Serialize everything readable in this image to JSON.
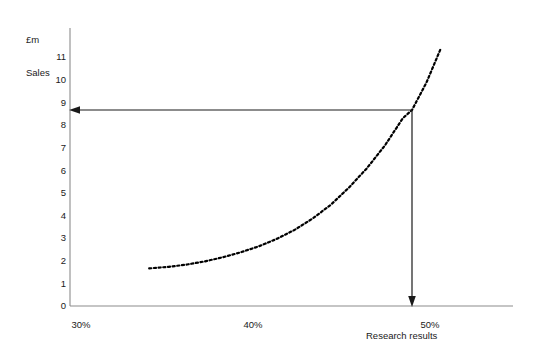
{
  "chart_data": {
    "type": "line",
    "title": "",
    "subtitle": "",
    "ylabel": "£m\nSales",
    "ylabel_line1": "£m",
    "ylabel_line2": "Sales",
    "xlabel": "Research results",
    "ylim": [
      0,
      11.5
    ],
    "xlim": [
      29,
      52
    ],
    "grid": false,
    "legend": null,
    "ytick_labels": [
      "11",
      "10",
      "9",
      "8",
      "7",
      "6",
      "5",
      "4",
      "3",
      "2",
      "1",
      "0"
    ],
    "ytick_values": [
      11,
      10,
      9,
      8,
      7,
      6,
      5,
      4,
      3,
      2,
      1,
      0
    ],
    "xtick_labels": [
      "30%",
      "40%",
      "50%"
    ],
    "xtick_values": [
      30,
      40,
      50
    ],
    "series": [
      {
        "name": "Sales curve",
        "style": "dotted",
        "color": "#000000",
        "x": [
          34.4,
          35.5,
          36.5,
          37.5,
          38.5,
          39.5,
          40.5,
          41.5,
          42.5,
          43.5,
          44.5,
          45.5,
          46.5,
          47.5,
          48.5,
          49.0,
          49.8,
          50.6
        ],
        "y": [
          1.65,
          1.72,
          1.82,
          1.96,
          2.14,
          2.36,
          2.62,
          2.95,
          3.35,
          3.85,
          4.45,
          5.2,
          6.05,
          7.05,
          8.25,
          8.6,
          9.8,
          11.3
        ]
      }
    ],
    "annotations": [
      {
        "name": "horizontal-readoff-arrow",
        "from_x": 49.0,
        "from_y": 8.6,
        "to_x": 30.0,
        "to_y": 8.6,
        "arrowhead": "end",
        "color": "#000000"
      },
      {
        "name": "vertical-readoff-arrow",
        "from_x": 49.0,
        "from_y": 8.6,
        "to_x": 49.0,
        "to_y": 0.0,
        "arrowhead": "end",
        "color": "#000000"
      }
    ],
    "read_off": {
      "x_percent": 49,
      "sales_value": 8.6
    }
  },
  "axes": {
    "y_axis_color": "#8c8c8c",
    "x_axis_color": "#8c8c8c"
  }
}
